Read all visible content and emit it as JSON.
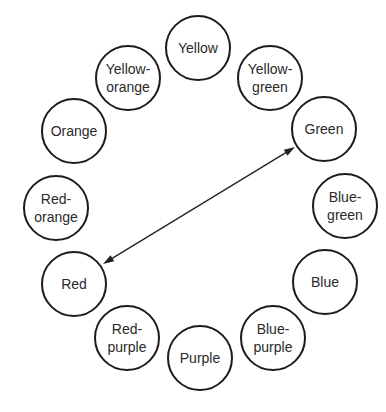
{
  "diagram": {
    "type": "color-wheel",
    "colors": {
      "stroke": "#1c1c1c",
      "text": "#2a2a2a",
      "background": "#ffffff"
    },
    "nodes": [
      {
        "id": "yellow",
        "lines": [
          "Yellow"
        ],
        "cx": 198,
        "cy": 48
      },
      {
        "id": "yellow-green",
        "lines": [
          "Yellow-",
          "green"
        ],
        "cx": 270,
        "cy": 78
      },
      {
        "id": "green",
        "lines": [
          "Green"
        ],
        "cx": 324,
        "cy": 129
      },
      {
        "id": "blue-green",
        "lines": [
          "Blue-",
          "green"
        ],
        "cx": 345,
        "cy": 206
      },
      {
        "id": "blue",
        "lines": [
          "Blue"
        ],
        "cx": 325,
        "cy": 282
      },
      {
        "id": "blue-purple",
        "lines": [
          "Blue-",
          "purple"
        ],
        "cx": 273,
        "cy": 338
      },
      {
        "id": "purple",
        "lines": [
          "Purple"
        ],
        "cx": 200,
        "cy": 358
      },
      {
        "id": "red-purple",
        "lines": [
          "Red-",
          "purple"
        ],
        "cx": 127,
        "cy": 338
      },
      {
        "id": "red",
        "lines": [
          "Red"
        ],
        "cx": 74,
        "cy": 284
      },
      {
        "id": "red-orange",
        "lines": [
          "Red-",
          "orange"
        ],
        "cx": 56,
        "cy": 208
      },
      {
        "id": "orange",
        "lines": [
          "Orange"
        ],
        "cx": 74,
        "cy": 131
      },
      {
        "id": "yellow-orange",
        "lines": [
          "Yellow-",
          "orange"
        ],
        "cx": 128,
        "cy": 78
      }
    ],
    "radius": 32,
    "edges": [
      {
        "from": "red",
        "to": "green",
        "type": "double-arrow",
        "x1": 103,
        "y1": 264,
        "x2": 295,
        "y2": 147
      }
    ]
  }
}
